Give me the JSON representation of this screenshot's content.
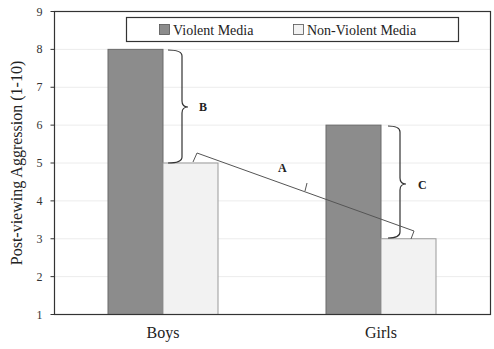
{
  "chart_data": {
    "type": "bar",
    "title": "",
    "xlabel": "",
    "ylabel": "Post-viewing Aggression (1-10)",
    "ylim": [
      1,
      9
    ],
    "yticks": [
      1,
      2,
      3,
      4,
      5,
      6,
      7,
      8,
      9
    ],
    "grid": true,
    "legend_position": "top",
    "categories": [
      "Boys",
      "Girls"
    ],
    "series": [
      {
        "name": "Violent Media",
        "values": [
          8,
          6
        ],
        "color": "#8c8c8c"
      },
      {
        "name": "Non-Violent Media",
        "values": [
          5,
          3
        ],
        "color": "#f2f2f2"
      }
    ],
    "annotations": [
      {
        "label": "B",
        "description": "Bracket spanning Boys Violent (8) to Boys Non-Violent (5)"
      },
      {
        "label": "A",
        "description": "Bracket line connecting Boys Non-Violent (5) to Girls Non-Violent (3)"
      },
      {
        "label": "C",
        "description": "Bracket spanning Girls Violent (6) to Girls Non-Violent (3)"
      }
    ]
  },
  "legend": {
    "items": [
      {
        "label": "Violent Media",
        "color": "#8c8c8c"
      },
      {
        "label": "Non-Violent Media",
        "color": "#f2f2f2"
      }
    ]
  },
  "axis": {
    "y_title": "Post-viewing Aggression (1-10)",
    "y_ticks": [
      "1",
      "2",
      "3",
      "4",
      "5",
      "6",
      "7",
      "8",
      "9"
    ],
    "x_categories": [
      "Boys",
      "Girls"
    ]
  },
  "annotations": {
    "a": "A",
    "b": "B",
    "c": "C"
  }
}
